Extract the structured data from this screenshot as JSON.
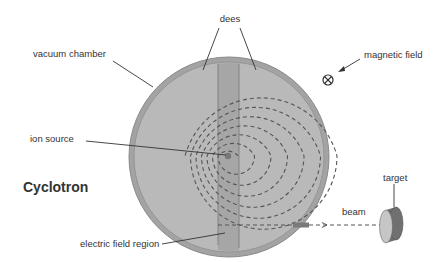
{
  "title": "Cyclotron",
  "labels": {
    "dees": "dees",
    "vacuum_chamber": "vacuum chamber",
    "magnetic_field": "magnetic field",
    "ion_source": "ion source",
    "electric_field_region": "electric field region",
    "beam": "beam",
    "target": "target"
  },
  "symbols": {
    "magnetic_field": "circle-cross-icon (field into page)"
  },
  "colors": {
    "chamber_outer": "#9a9a9a",
    "dee_fill": "#bdbdbd",
    "gap_fill": "#a8a8a8",
    "ion_source": "#7a7a7a",
    "path_stroke": "#555555",
    "text": "#333333"
  }
}
